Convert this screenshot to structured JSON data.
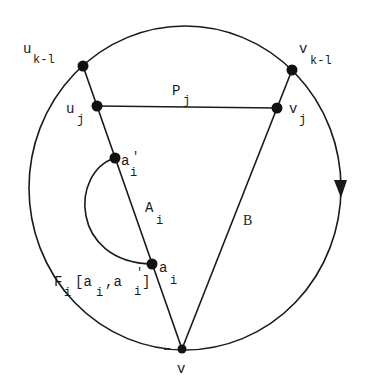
{
  "diagram": {
    "colors": {
      "ink": "#1a1a1a",
      "background": "#ffffff"
    },
    "circle": {
      "cx": 185,
      "cy": 188,
      "rx": 156,
      "ry": 162,
      "direction": "clockwise",
      "arrow_at": [
        340,
        188
      ]
    },
    "nodes": [
      {
        "id": "u_k-1",
        "x": 83,
        "y": 66
      },
      {
        "id": "u_j",
        "x": 97,
        "y": 106
      },
      {
        "id": "a_i_prime",
        "x": 115,
        "y": 158
      },
      {
        "id": "a_i",
        "x": 152,
        "y": 264
      },
      {
        "id": "v",
        "x": 182,
        "y": 349
      },
      {
        "id": "v_j",
        "x": 277,
        "y": 108
      },
      {
        "id": "v_k-1",
        "x": 292,
        "y": 70
      }
    ],
    "labels": {
      "u_k1": {
        "base": "u",
        "sub": "k-l"
      },
      "u_j": {
        "base": "u",
        "sub": "j"
      },
      "v_k1": {
        "base": "v",
        "sub": "k-l"
      },
      "v_j": {
        "base": "v",
        "sub": "j"
      },
      "P_j": {
        "base": "P",
        "sub": "j"
      },
      "a_i_prime": {
        "base": "a",
        "sup": "'",
        "sub": "i"
      },
      "A_i": {
        "base": "A",
        "sub": "i"
      },
      "B": {
        "base": "B"
      },
      "a_i": {
        "base": "a",
        "sub": "i"
      },
      "F_i": {
        "base": "F",
        "sub": "i",
        "bracket_open": "[a",
        "sub1": "i",
        "comma": ",a",
        "sup2": "'",
        "sub2": "i",
        "bracket_close": "]"
      },
      "v": {
        "base": "v"
      }
    },
    "edges": [
      {
        "from": "u_k-1",
        "to": "v",
        "name": "A_i"
      },
      {
        "from": "v_k-1",
        "to": "v",
        "name": "B"
      },
      {
        "from": "u_j",
        "to": "v_j",
        "name": "P_j"
      },
      {
        "from": "a_i",
        "to": "a_i_prime",
        "name": "F_i[a_i,a_i']",
        "shape": "arc"
      }
    ]
  }
}
